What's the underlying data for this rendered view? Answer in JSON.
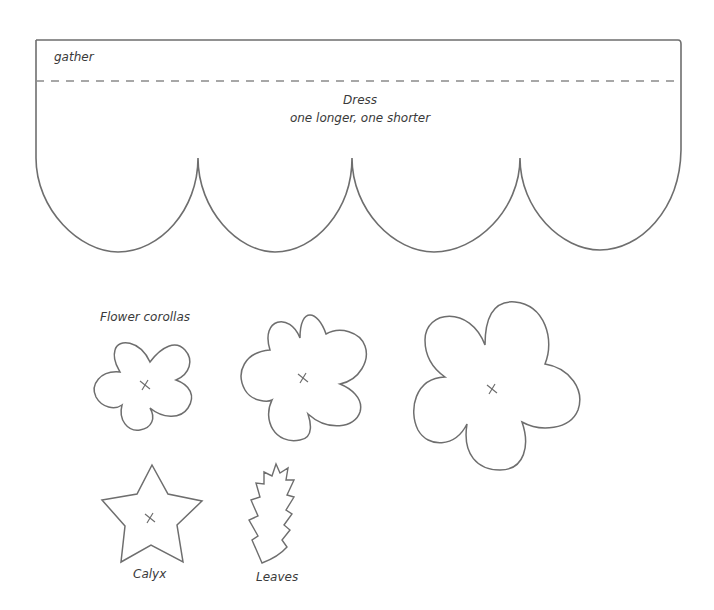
{
  "pattern": {
    "dress": {
      "gather_label": "gather",
      "title": "Dress",
      "note": "one longer, one shorter",
      "scallop_count": 4
    },
    "corollas": {
      "label": "Flower corollas",
      "count": 3,
      "center_mark": "x"
    },
    "calyx": {
      "label": "Calyx"
    },
    "leaves": {
      "label": "Leaves"
    },
    "colors": {
      "line": "#6e6e6e",
      "dashed": "#8a8a8a",
      "text": "#3a3a3a",
      "background": "#ffffff"
    }
  }
}
